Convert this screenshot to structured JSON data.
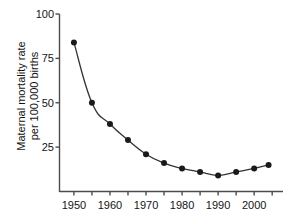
{
  "chart_data": {
    "type": "line",
    "title": "",
    "xlabel": "",
    "ylabel": "Maternal mortality rate per 100,000 births",
    "ylabel_line1": "Maternal mortality rate",
    "ylabel_line2": "per 100,000 births",
    "x": [
      1950,
      1955,
      1960,
      1965,
      1970,
      1975,
      1980,
      1985,
      1990,
      1995,
      2000,
      2004
    ],
    "values": [
      84,
      50,
      38,
      29,
      21,
      16,
      13,
      11,
      9,
      11,
      13,
      15
    ],
    "series": [
      {
        "name": "Maternal mortality rate",
        "values": [
          84,
          50,
          38,
          29,
          21,
          16,
          13,
          11,
          9,
          11,
          13,
          15
        ]
      }
    ],
    "xlim": [
      1946,
      2008
    ],
    "ylim": [
      0,
      100
    ],
    "ytick_values": [
      25,
      50,
      75,
      100
    ],
    "ytick_labels": [
      "25",
      "50",
      "75",
      "100"
    ],
    "xtick_values": [
      1950,
      1955,
      1960,
      1965,
      1970,
      1975,
      1980,
      1985,
      1990,
      1995,
      2000,
      2005
    ],
    "xtick_labels": [
      "1950",
      "",
      "1960",
      "",
      "1970",
      "",
      "1980",
      "",
      "1990",
      "",
      "2000",
      ""
    ],
    "grid": false,
    "legend": false,
    "legend_position": "none",
    "marker": "filled-circle",
    "line_color": "#333333",
    "marker_color": "#1a1a1a",
    "axis_color": "#4d4d4d",
    "background_color": "#ffffff"
  }
}
